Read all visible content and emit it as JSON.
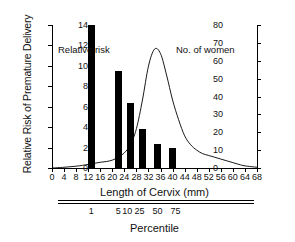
{
  "chart_data": {
    "type": "bar",
    "title": "",
    "xlabel": "Length of Cervix (mm)",
    "ylabel": "Relative Risk of Premature Delivery",
    "ylabel_right": "No. of women",
    "secondary_xlabel": "Percentile",
    "xlim": [
      0,
      68
    ],
    "ylim": [
      0,
      14
    ],
    "ylim_right": [
      0,
      80
    ],
    "grid": false,
    "legend": "none",
    "xticks": [
      0,
      4,
      8,
      12,
      16,
      20,
      24,
      28,
      32,
      36,
      40,
      44,
      48,
      52,
      56,
      60,
      64,
      68
    ],
    "yticks": [
      0,
      2,
      4,
      6,
      8,
      10,
      12,
      14
    ],
    "yticks_right": [
      0,
      10,
      20,
      30,
      40,
      50,
      60,
      70,
      80
    ],
    "percentile_ticks": [
      {
        "label": "1",
        "x": 13
      },
      {
        "label": "5",
        "x": 22
      },
      {
        "label": "10",
        "x": 25
      },
      {
        "label": "25",
        "x": 29
      },
      {
        "label": "50",
        "x": 35
      },
      {
        "label": "75",
        "x": 41
      }
    ],
    "series": [
      {
        "name": "Relative risk",
        "type": "bar",
        "axis": "left",
        "x": [
          13,
          22,
          26,
          30,
          35,
          40
        ],
        "values": [
          14.0,
          9.5,
          6.4,
          3.8,
          2.4,
          2.0
        ]
      },
      {
        "name": "No. of women",
        "type": "line",
        "axis": "right",
        "x": [
          0,
          4,
          8,
          12,
          14,
          16,
          18,
          20,
          22,
          24,
          26,
          28,
          30,
          32,
          34,
          36,
          38,
          40,
          42,
          44,
          46,
          48,
          50,
          52,
          54,
          56,
          58,
          60,
          62,
          64,
          68
        ],
        "values": [
          0,
          0.4,
          1.0,
          2.0,
          2.6,
          3.2,
          3.6,
          4.4,
          6.0,
          8.5,
          13.0,
          22.0,
          38.0,
          57.0,
          66.5,
          64.0,
          52.0,
          38.0,
          27.0,
          18.0,
          13.0,
          10.0,
          8.0,
          7.0,
          6.0,
          5.0,
          4.0,
          3.0,
          2.0,
          1.2,
          0.4
        ]
      }
    ],
    "annotations": [
      {
        "name": "relative-risk",
        "text": "Relative risk"
      },
      {
        "name": "no-of-women",
        "text": "No. of women"
      }
    ]
  },
  "colors": {
    "bar": "#000000",
    "line": "#000000",
    "axis": "#000000",
    "background": "#ffffff"
  }
}
